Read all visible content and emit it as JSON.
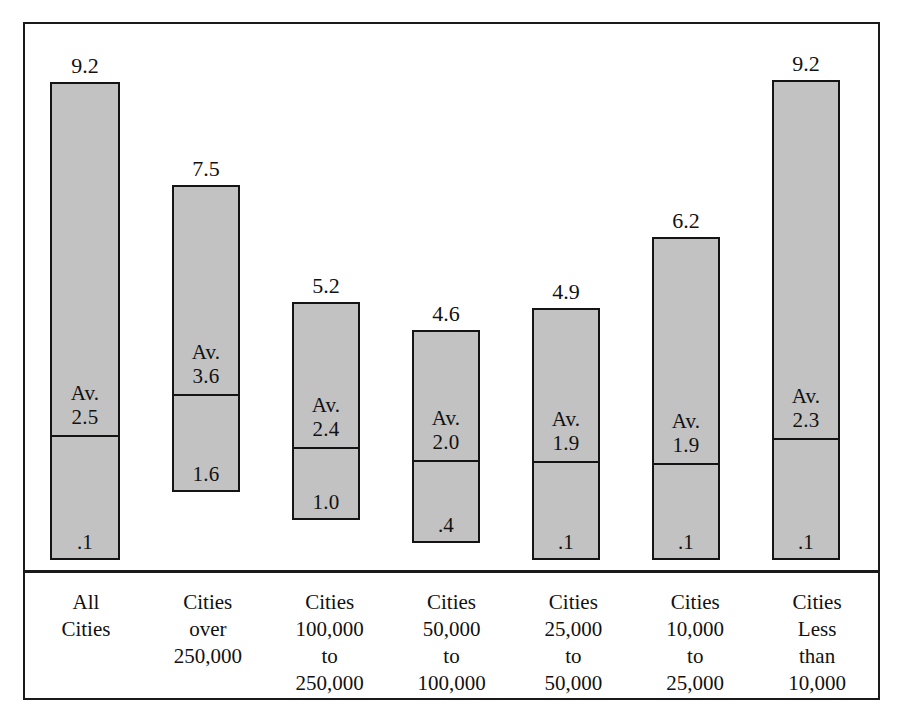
{
  "chart_data": {
    "type": "bar",
    "title": "",
    "subtitle": "",
    "xlabel": "",
    "ylabel": "",
    "grid": false,
    "legend": "none",
    "ylim": [
      0,
      10
    ],
    "note": "Floating range bars. Each bar spans from a minimum value (bottom label) to a maximum value (top label above the bar), divided by a horizontal rule at the average value (labelled 'Av.').",
    "categories": [
      "All Cities",
      "Cities over 250,000",
      "Cities 100,000 to 250,000",
      "Cities 50,000 to 100,000",
      "Cities 25,000 to 50,000",
      "Cities 10,000 to 25,000",
      "Cities Less than 10,000"
    ],
    "category_lines": [
      [
        "All",
        "Cities"
      ],
      [
        "Cities",
        "over",
        "250,000"
      ],
      [
        "Cities",
        "100,000",
        "to",
        "250,000"
      ],
      [
        "Cities",
        "50,000",
        "to",
        "100,000"
      ],
      [
        "Cities",
        "25,000",
        "to",
        "50,000"
      ],
      [
        "Cities",
        "10,000",
        "to",
        "25,000"
      ],
      [
        "Cities",
        "Less",
        "than",
        "10,000"
      ]
    ],
    "series": [
      {
        "name": "max",
        "values": [
          9.2,
          7.5,
          5.2,
          4.6,
          4.9,
          6.2,
          9.2
        ]
      },
      {
        "name": "average",
        "values": [
          2.5,
          3.6,
          2.4,
          2.0,
          1.9,
          1.9,
          2.3
        ]
      },
      {
        "name": "min",
        "values": [
          0.1,
          1.6,
          1.0,
          0.4,
          0.1,
          0.1,
          0.1
        ]
      }
    ]
  },
  "bars": [
    {
      "top_label": "9.2",
      "avg_prefix": "Av.",
      "avg_label": "2.5",
      "min_label": ".1",
      "max": 9.2,
      "avg": 2.5,
      "min": 0.1,
      "left_px": 50,
      "width_px": 70,
      "top_px": 82,
      "divider_px": 437,
      "bottom_px": 560
    },
    {
      "top_label": "7.5",
      "avg_prefix": "Av.",
      "avg_label": "3.6",
      "min_label": "1.6",
      "max": 7.5,
      "avg": 3.6,
      "min": 1.6,
      "left_px": 172,
      "width_px": 68,
      "top_px": 185,
      "divider_px": 396,
      "bottom_px": 492
    },
    {
      "top_label": "5.2",
      "avg_prefix": "Av.",
      "avg_label": "2.4",
      "min_label": "1.0",
      "max": 5.2,
      "avg": 2.4,
      "min": 1.0,
      "left_px": 292,
      "width_px": 68,
      "top_px": 302,
      "divider_px": 449,
      "bottom_px": 520
    },
    {
      "top_label": "4.6",
      "avg_prefix": "Av.",
      "avg_label": "2.0",
      "min_label": ".4",
      "max": 4.6,
      "avg": 2.0,
      "min": 0.4,
      "left_px": 412,
      "width_px": 68,
      "top_px": 330,
      "divider_px": 462,
      "bottom_px": 543
    },
    {
      "top_label": "4.9",
      "avg_prefix": "Av.",
      "avg_label": "1.9",
      "min_label": ".1",
      "max": 4.9,
      "avg": 1.9,
      "min": 0.1,
      "left_px": 532,
      "width_px": 68,
      "top_px": 308,
      "divider_px": 463,
      "bottom_px": 560
    },
    {
      "top_label": "6.2",
      "avg_prefix": "Av.",
      "avg_label": "1.9",
      "min_label": ".1",
      "max": 6.2,
      "avg": 1.9,
      "min": 0.1,
      "left_px": 652,
      "width_px": 68,
      "top_px": 237,
      "divider_px": 465,
      "bottom_px": 560
    },
    {
      "top_label": "9.2",
      "avg_prefix": "Av.",
      "avg_label": "2.3",
      "min_label": ".1",
      "max": 9.2,
      "avg": 2.3,
      "min": 0.1,
      "left_px": 772,
      "width_px": 68,
      "top_px": 80,
      "divider_px": 440,
      "bottom_px": 560
    }
  ],
  "style": {
    "bar_fill": "#c2c2c2",
    "bar_stroke": "#141414",
    "frame_stroke": "#1a1a1a",
    "page_background": "#ffffff",
    "text_color": "#111111"
  }
}
